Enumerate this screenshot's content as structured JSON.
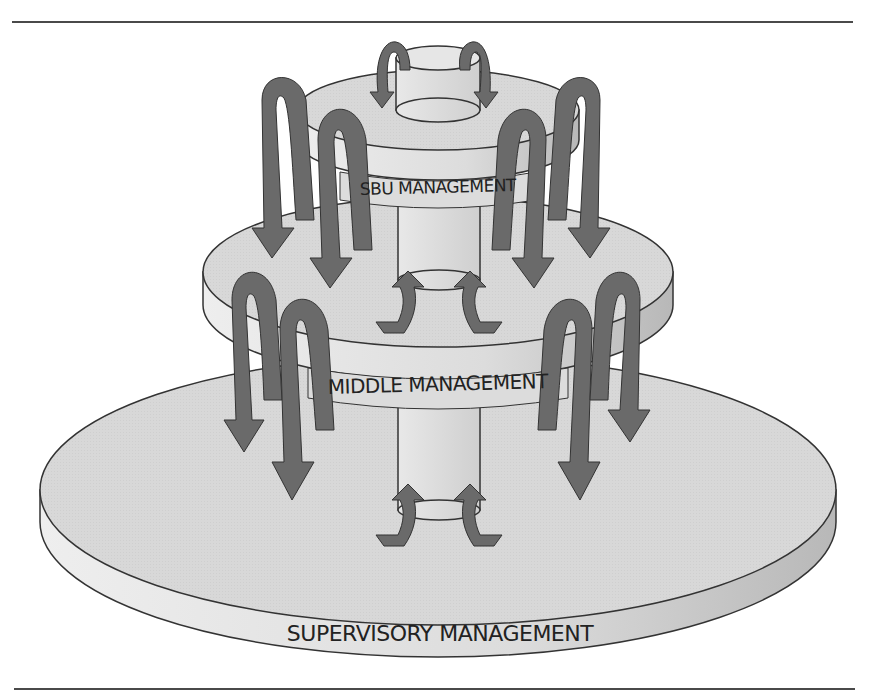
{
  "header": {
    "caption_fragment": "Figure — top-down and bottom-up planning flow (caption cut off)"
  },
  "diagram": {
    "title": "",
    "tiers": [
      {
        "level": 1,
        "label": "SBU MANAGEMENT"
      },
      {
        "level": 2,
        "label": "MIDDLE MANAGEMENT"
      },
      {
        "level": 3,
        "label": "SUPERVISORY MANAGEMENT"
      }
    ],
    "flows": {
      "downward_arrows_per_tier": 4,
      "upward_arrows_per_tier": 2,
      "description": "Large curved arrows descend from each tier to the tier below; small curved arrows rise from the central column into the tier above"
    },
    "colors": {
      "disc_fill": "#d9d9d9",
      "disc_side": "#e6e6e6",
      "column_fill": "#e0e0e0",
      "arrow_fill": "#6a6a6a",
      "outline": "#333333",
      "rule": "#4a4a4a"
    }
  }
}
